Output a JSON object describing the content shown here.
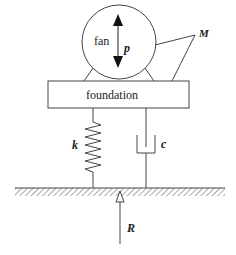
{
  "diagram": {
    "title": "",
    "labels": {
      "fan": "fan",
      "force": "p",
      "mass": "M",
      "foundation": "foundation",
      "spring": "k",
      "damper": "c",
      "reaction": "R"
    },
    "colors": {
      "stroke": "#444444",
      "text": "#222222",
      "background": "#ffffff"
    }
  }
}
